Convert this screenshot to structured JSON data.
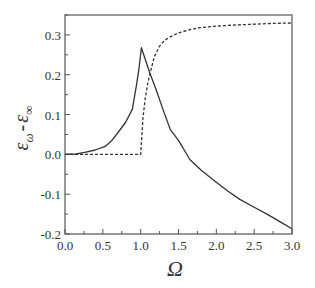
{
  "chart_data": {
    "type": "line",
    "title": "",
    "xlabel": "Ω",
    "ylabel": "ε_ω - ε_∞",
    "ylabel_parts": {
      "base1": "ε",
      "sub1": "ω",
      "dash": "-",
      "base2": "ε",
      "sub2": "∞"
    },
    "xlim": [
      0.0,
      3.0
    ],
    "ylim": [
      -0.2,
      0.35
    ],
    "x_ticks": [
      0.0,
      0.5,
      1.0,
      1.5,
      2.0,
      2.5,
      3.0
    ],
    "x_tick_labels": [
      "0.0",
      "0.5",
      "1.0",
      "1.5",
      "2.0",
      "2.5",
      "3.0"
    ],
    "x_minor_step": 0.25,
    "y_ticks": [
      -0.2,
      -0.1,
      0.0,
      0.1,
      0.2,
      0.3
    ],
    "y_tick_labels": [
      "-0.2",
      "-0.1",
      "0.0",
      "0.1",
      "0.2",
      "0.3"
    ],
    "y_minor_step": 0.05,
    "grid": false,
    "legend": null,
    "series": [
      {
        "name": "solid",
        "style": "solid",
        "color": "#333333",
        "x": [
          0.0,
          0.15,
          0.26,
          0.4,
          0.53,
          0.62,
          0.7,
          0.8,
          0.89,
          0.95,
          0.98,
          1.01,
          1.05,
          1.12,
          1.2,
          1.3,
          1.39,
          1.5,
          1.65,
          1.8,
          2.0,
          2.15,
          2.31,
          2.5,
          2.67,
          2.85,
          3.0
        ],
        "y": [
          0.0,
          0.001,
          0.005,
          0.011,
          0.02,
          0.035,
          0.055,
          0.08,
          0.113,
          0.18,
          0.22,
          0.268,
          0.245,
          0.205,
          0.165,
          0.11,
          0.063,
          0.035,
          -0.013,
          -0.04,
          -0.07,
          -0.092,
          -0.113,
          -0.133,
          -0.15,
          -0.17,
          -0.187
        ]
      },
      {
        "name": "dashed",
        "style": "dashed",
        "color": "#333333",
        "x": [
          0.0,
          0.5,
          0.99,
          1.0,
          1.03,
          1.06,
          1.09,
          1.12,
          1.18,
          1.25,
          1.32,
          1.39,
          1.5,
          1.65,
          1.78,
          2.0,
          2.25,
          2.5,
          2.75,
          3.0
        ],
        "y": [
          0.0,
          0.0,
          0.0,
          0.0,
          0.09,
          0.14,
          0.175,
          0.2,
          0.245,
          0.272,
          0.287,
          0.295,
          0.305,
          0.313,
          0.318,
          0.322,
          0.325,
          0.327,
          0.329,
          0.33
        ]
      }
    ]
  }
}
